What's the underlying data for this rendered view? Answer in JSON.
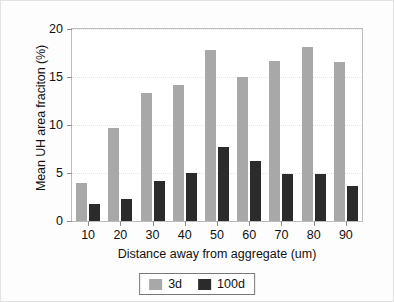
{
  "chart_data": {
    "type": "bar",
    "title": "",
    "xlabel": "Distance away from aggregate (um)",
    "ylabel": "Mean UH area fraciton (%)",
    "categories": [
      "10",
      "20",
      "30",
      "40",
      "50",
      "60",
      "70",
      "80",
      "90"
    ],
    "series": [
      {
        "name": "3d",
        "color": "#a8a8a8",
        "values": [
          4.0,
          9.7,
          13.3,
          14.2,
          17.8,
          15.0,
          16.7,
          18.1,
          16.6
        ]
      },
      {
        "name": "100d",
        "color": "#2b2b2b",
        "values": [
          1.8,
          2.3,
          4.2,
          5.0,
          7.7,
          6.2,
          4.9,
          4.9,
          3.6
        ]
      }
    ],
    "ylim": [
      0,
      20
    ],
    "yticks": [
      "0",
      "5",
      "10",
      "15",
      "20"
    ],
    "ytick_values": [
      0,
      5,
      10,
      15,
      20
    ],
    "grid": true,
    "legend_position": "bottom-center"
  },
  "legend": {
    "entries": [
      {
        "label": "3d"
      },
      {
        "label": "100d"
      }
    ]
  }
}
